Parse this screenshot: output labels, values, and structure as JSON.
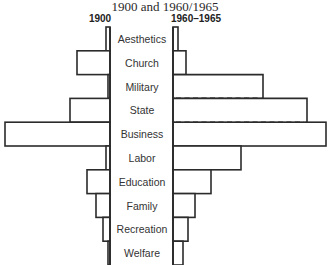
{
  "chart_data": {
    "type": "bar",
    "orientation": "horizontal-back-to-back",
    "title": "1900 and 1960/1965",
    "xlabel": "",
    "ylabel": "",
    "grid": false,
    "legend": "column headings above each side",
    "categories": [
      "Aesthetics",
      "Church",
      "Military",
      "State",
      "Business",
      "Labor",
      "Education",
      "Family",
      "Recreation",
      "Welfare"
    ],
    "series": [
      {
        "name": "1900",
        "side": "left",
        "values": [
          4,
          33,
          2,
          40,
          105,
          4,
          23,
          14,
          7,
          2
        ]
      },
      {
        "name": "1960–1965",
        "side": "right",
        "values": [
          5,
          13,
          90,
          134,
          153,
          68,
          38,
          22,
          15,
          10
        ]
      }
    ],
    "annotations": [
      {
        "category": "Military",
        "series": "1960–1965",
        "style": "dashed lower edge"
      },
      {
        "category": "State",
        "series": "1960–1965",
        "style": "dashed lower edge"
      }
    ]
  },
  "headers": {
    "title": "1900 and 1960/1965",
    "left": "1900",
    "right": "1960–1965"
  }
}
